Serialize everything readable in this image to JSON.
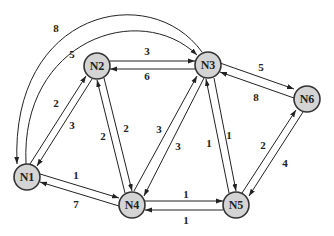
{
  "diagram": {
    "type": "directed-weighted-graph",
    "nodes": [
      {
        "id": "N1",
        "label": "N1",
        "x": 27,
        "y": 177
      },
      {
        "id": "N2",
        "label": "N2",
        "x": 97,
        "y": 66
      },
      {
        "id": "N3",
        "label": "N3",
        "x": 208,
        "y": 65
      },
      {
        "id": "N4",
        "label": "N4",
        "x": 132,
        "y": 205
      },
      {
        "id": "N5",
        "label": "N5",
        "x": 236,
        "y": 205
      },
      {
        "id": "N6",
        "label": "N6",
        "x": 307,
        "y": 99
      }
    ],
    "edges": [
      {
        "from": "N3",
        "to": "N1",
        "weight": "8"
      },
      {
        "from": "N1",
        "to": "N3",
        "weight": "5"
      },
      {
        "from": "N1",
        "to": "N2",
        "weight": "2"
      },
      {
        "from": "N2",
        "to": "N1",
        "weight": "3"
      },
      {
        "from": "N2",
        "to": "N3",
        "weight": "3"
      },
      {
        "from": "N3",
        "to": "N2",
        "weight": "6"
      },
      {
        "from": "N4",
        "to": "N2",
        "weight": "2"
      },
      {
        "from": "N2",
        "to": "N4",
        "weight": "2"
      },
      {
        "from": "N4",
        "to": "N3",
        "weight": "3"
      },
      {
        "from": "N3",
        "to": "N4",
        "weight": "3"
      },
      {
        "from": "N5",
        "to": "N3",
        "weight": "1"
      },
      {
        "from": "N3",
        "to": "N5",
        "weight": "1"
      },
      {
        "from": "N3",
        "to": "N6",
        "weight": "5"
      },
      {
        "from": "N6",
        "to": "N3",
        "weight": "8"
      },
      {
        "from": "N1",
        "to": "N4",
        "weight": "1"
      },
      {
        "from": "N4",
        "to": "N1",
        "weight": "7"
      },
      {
        "from": "N4",
        "to": "N5",
        "weight": "1"
      },
      {
        "from": "N5",
        "to": "N4",
        "weight": "1"
      },
      {
        "from": "N5",
        "to": "N6",
        "weight": "2"
      },
      {
        "from": "N6",
        "to": "N5",
        "weight": "4"
      }
    ]
  },
  "labels": {
    "n1": "N1",
    "n2": "N2",
    "n3": "N3",
    "n4": "N4",
    "n5": "N5",
    "n6": "N6",
    "w_n3_n1": "8",
    "w_n1_n3": "5",
    "w_n1_n2": "2",
    "w_n2_n1": "3",
    "w_n2_n3": "3",
    "w_n3_n2": "6",
    "w_n4_n2": "2",
    "w_n2_n4": "2",
    "w_n4_n3": "3",
    "w_n3_n4": "3",
    "w_n5_n3": "1",
    "w_n3_n5": "1",
    "w_n3_n6": "5",
    "w_n6_n3": "8",
    "w_n1_n4": "1",
    "w_n4_n1": "7",
    "w_n4_n5": "1",
    "w_n5_n4": "1",
    "w_n5_n6": "2",
    "w_n6_n5": "4"
  }
}
